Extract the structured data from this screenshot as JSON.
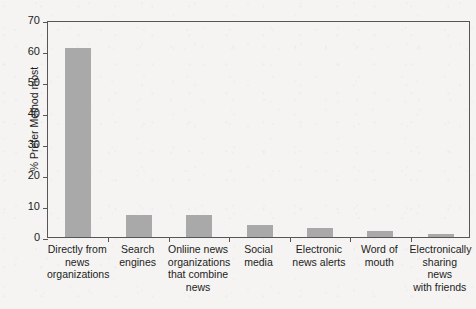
{
  "chart_data": {
    "type": "bar",
    "title": "",
    "xlabel": "",
    "ylabel": "% Prefer Method most",
    "ylim": [
      0,
      70
    ],
    "yticks": [
      0,
      10,
      20,
      30,
      40,
      50,
      60,
      70
    ],
    "grid": false,
    "legend": "none",
    "bar_color": "#a9a9a9",
    "axis_color": "#565656",
    "background_color": "#f5f4f2",
    "categories": [
      "Directly from news organizations",
      "Search engines",
      "Onliine news organizations that combine news",
      "Social media",
      "Electronic news alerts",
      "Word of mouth",
      "Electronically sharing news with friends"
    ],
    "category_lines": [
      [
        "Directly from",
        "news",
        "organizations"
      ],
      [
        "Search",
        "engines"
      ],
      [
        "Onliine news",
        "organizations",
        "that combine",
        "news"
      ],
      [
        "Social",
        "media"
      ],
      [
        "Electronic",
        "news alerts"
      ],
      [
        "Word of",
        "mouth"
      ],
      [
        "Electronically",
        "sharing news",
        "with friends"
      ]
    ],
    "values": [
      61,
      7,
      7,
      4,
      3,
      2,
      1
    ]
  }
}
